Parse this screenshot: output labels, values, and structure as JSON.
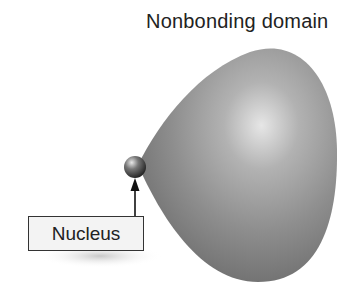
{
  "diagram": {
    "title": "Nonbonding domain",
    "labels": {
      "nucleus": "Nucleus"
    },
    "elements": [
      {
        "type": "lobe",
        "name": "nonbonding-domain",
        "color": "#8a8a8a"
      },
      {
        "type": "sphere",
        "name": "nucleus",
        "color": "#555555"
      },
      {
        "type": "arrow",
        "from": "nucleus-label",
        "to": "nucleus"
      }
    ]
  }
}
